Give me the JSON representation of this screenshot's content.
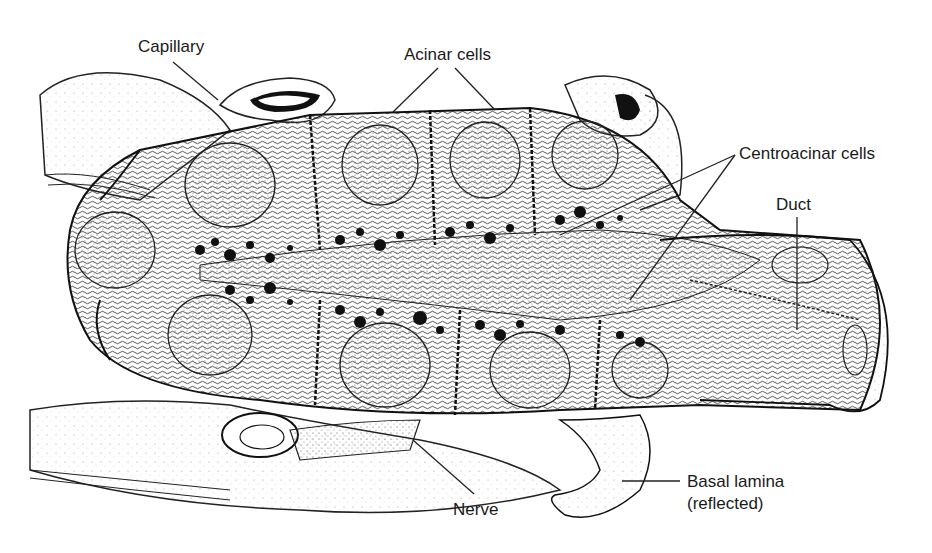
{
  "diagram": {
    "labels": {
      "capillary": "Capillary",
      "acinar_cells": "Acinar cells",
      "centroacinar_cells": "Centroacinar cells",
      "duct": "Duct",
      "nerve": "Nerve",
      "basal_lamina_line1": "Basal lamina",
      "basal_lamina_line2": "(reflected)"
    }
  }
}
